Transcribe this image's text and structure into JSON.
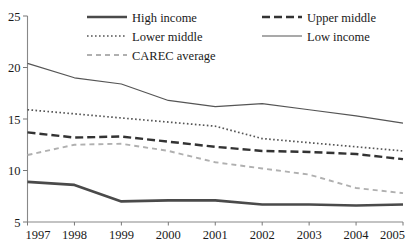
{
  "chart_data": {
    "type": "line",
    "title": "",
    "subtitle": "",
    "xlabel": "",
    "ylabel": "",
    "x": [
      1997,
      1998,
      1999,
      2000,
      2001,
      2002,
      2003,
      2004,
      2005
    ],
    "categories": [
      "1997",
      "1998",
      "1999",
      "2000",
      "2001",
      "2002",
      "2003",
      "2004",
      "2005"
    ],
    "xlim": [
      1997,
      2005
    ],
    "ylim": [
      5,
      25
    ],
    "yticks": [
      5,
      10,
      15,
      20,
      25
    ],
    "ytick_labels": [
      "5",
      "10",
      "15",
      "20",
      "25"
    ],
    "grid": false,
    "legend_position": "top",
    "series": [
      {
        "name": "High income",
        "style": "solid-thick",
        "color": "#4a4a4a",
        "values": [
          8.9,
          8.6,
          7.0,
          7.1,
          7.1,
          6.7,
          6.7,
          6.6,
          6.7
        ]
      },
      {
        "name": "Upper middle",
        "style": "dashed-thick",
        "color": "#333333",
        "values": [
          13.7,
          13.2,
          13.3,
          12.8,
          12.3,
          11.9,
          11.8,
          11.6,
          11.1
        ]
      },
      {
        "name": "Lower middle",
        "style": "dotted",
        "color": "#555555",
        "values": [
          15.9,
          15.5,
          15.1,
          14.7,
          14.3,
          13.1,
          12.7,
          12.3,
          11.9
        ]
      },
      {
        "name": "Low income",
        "style": "solid-thin",
        "color": "#555555",
        "values": [
          20.4,
          19.0,
          18.4,
          16.8,
          16.2,
          16.5,
          15.9,
          15.3,
          14.6
        ]
      },
      {
        "name": "CAREC average",
        "style": "dashed-light",
        "color": "#b0b0b0",
        "values": [
          11.5,
          12.5,
          12.6,
          11.9,
          10.8,
          10.2,
          9.6,
          8.3,
          7.8
        ]
      }
    ]
  },
  "legend": {
    "entries": [
      {
        "label": "High income",
        "column": "left",
        "row": 0
      },
      {
        "label": "Lower middle",
        "column": "left",
        "row": 1
      },
      {
        "label": "CAREC average",
        "column": "left",
        "row": 2
      },
      {
        "label": "Upper middle",
        "column": "right",
        "row": 0
      },
      {
        "label": "Low income",
        "column": "right",
        "row": 1
      }
    ]
  },
  "axes": {
    "y_ticks": [
      "25",
      "20",
      "15",
      "10",
      "5"
    ],
    "x_ticks": [
      "1997",
      "1998",
      "1999",
      "2000",
      "2001",
      "2002",
      "2003",
      "2004",
      "2005"
    ]
  }
}
